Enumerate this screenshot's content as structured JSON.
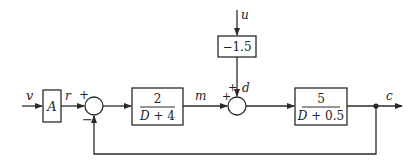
{
  "diagram": {
    "type": "block-diagram",
    "signals": {
      "input": "v",
      "reference": "r",
      "manipulated": "m",
      "disturbance_in": "u",
      "disturbance": "d",
      "output": "c"
    },
    "blocks": {
      "gain_A": "A",
      "controller": {
        "numerator": "2",
        "denominator": "D + 4"
      },
      "disturbance_gain": "−1.5",
      "plant": {
        "numerator": "5",
        "denominator": "D + 0.5"
      }
    },
    "summing_junctions": {
      "sum1": {
        "top_sign": "+",
        "bottom_sign": "−"
      },
      "sum2": {
        "left_sign": "+",
        "top_sign": "+"
      }
    },
    "colors": {
      "line": "#2a2a2a",
      "background": "#ffffff"
    }
  }
}
